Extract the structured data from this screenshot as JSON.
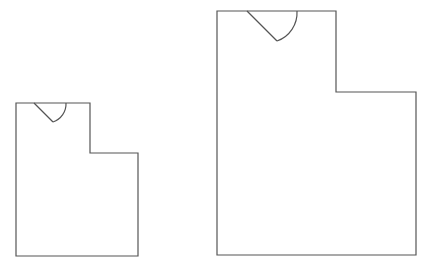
{
  "diagram": {
    "type": "floor-plan-outlines",
    "colors": {
      "background": "#ffffff",
      "stroke": "#555555"
    },
    "shapes": [
      {
        "id": "small-room",
        "outline": "16,103 90,103 90,153 138,153 138,256 16,256",
        "door": {
          "hinge_line": "M34,103 L53,122",
          "swing_arc": "M53,122 A19,19 0 0 0 66,103"
        }
      },
      {
        "id": "large-room",
        "outline": "217,11 336,11 336,92 416,92 416,255 217,255",
        "door": {
          "hinge_line": "M247,11 L277,41",
          "swing_arc": "M277,41 A30,30 0 0 0 297,11"
        }
      }
    ]
  }
}
